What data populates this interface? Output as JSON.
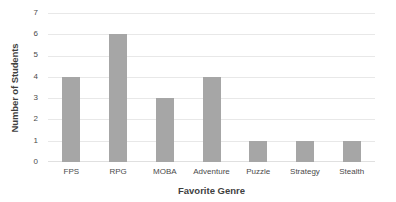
{
  "chart_data": {
    "type": "bar",
    "title": "",
    "subtitle": "",
    "categories": [
      "FPS",
      "RPG",
      "MOBA",
      "Adventure",
      "Puzzle",
      "Strategy",
      "Stealth"
    ],
    "values": [
      4,
      6,
      3,
      4,
      1,
      1,
      1
    ],
    "xlabel": "Favorite Genre",
    "ylabel": "Number of Students",
    "ylim": [
      0,
      7
    ],
    "ytick_labels": [
      "0",
      "1",
      "2",
      "3",
      "4",
      "5",
      "6",
      "7"
    ],
    "ytick_values": [
      0,
      1,
      2,
      3,
      4,
      5,
      6,
      7
    ],
    "grid": true,
    "grid_axis": "y",
    "legend": false,
    "legend_position": "none",
    "bar_color": "#a6a6a6",
    "gridline_color": "#e8e8e8",
    "background_color": "#ffffff",
    "text_color": "#4a4a4a",
    "axis_title_color": "#3f3f3f"
  }
}
